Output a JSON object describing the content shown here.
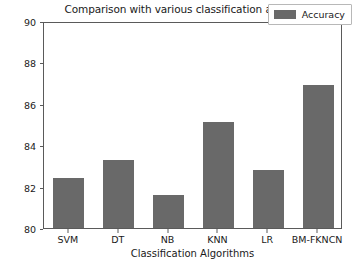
{
  "chart_data": {
    "type": "bar",
    "title": "Comparison with various classification algorithms",
    "xlabel": "Classification Algorithms",
    "ylabel": "",
    "categories": [
      "SVM",
      "DT",
      "NB",
      "KNN",
      "LR",
      "BM-FKNCN"
    ],
    "values": [
      82.4,
      83.3,
      81.6,
      85.1,
      82.8,
      86.9
    ],
    "series": [
      {
        "name": "Accuracy",
        "values": [
          82.4,
          83.3,
          81.6,
          85.1,
          82.8,
          86.9
        ],
        "color": "#696969"
      }
    ],
    "ylim": [
      80,
      90
    ],
    "yticks": [
      80,
      82,
      84,
      86,
      88,
      90
    ],
    "ytick_labels": [
      "80",
      "82",
      "84",
      "86",
      "88",
      "90"
    ],
    "grid": false,
    "legend": {
      "entries": [
        "Accuracy"
      ],
      "position": "upper right"
    },
    "bar_color": "#696969",
    "axes_color": "#5a5a5a",
    "background": "#ffffff"
  }
}
